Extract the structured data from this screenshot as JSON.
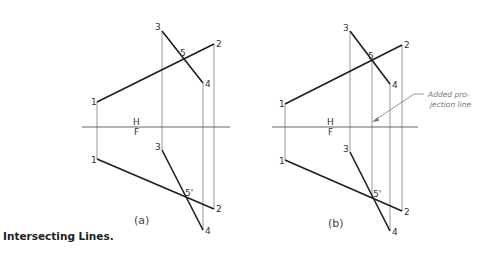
{
  "caption": "Intersecting Lines.",
  "views": [
    {
      "id": "a",
      "label": "(a)",
      "fold_top": "H",
      "fold_bottom": "F",
      "points_top": {
        "1": "1",
        "2": "2",
        "3": "3",
        "4": "4",
        "5": "5"
      },
      "points_front": {
        "1": "1",
        "2": "2",
        "3": "3",
        "4": "4",
        "5": "5'"
      },
      "has_added_projection": false
    },
    {
      "id": "b",
      "label": "(b)",
      "fold_top": "H",
      "fold_bottom": "F",
      "points_top": {
        "1": "1",
        "2": "2",
        "3": "3",
        "4": "4",
        "5": "5"
      },
      "points_front": {
        "1": "1",
        "2": "2",
        "3": "3",
        "4": "4",
        "5": "5'"
      },
      "has_added_projection": true,
      "note_line1": "Added pro-",
      "note_line2": "jection line"
    }
  ]
}
